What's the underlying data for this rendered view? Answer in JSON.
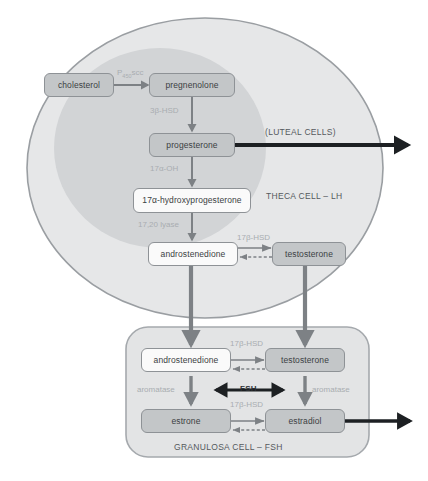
{
  "diagram": {
    "colors": {
      "theca_fill": "#e6e7e8",
      "theca_inner_fill": "#d2d4d6",
      "theca_stroke": "#9a9ea2",
      "granulosa_fill": "#e3e4e5",
      "granulosa_stroke": "#a5a9ad",
      "box_fill_gray": "#c3c6c8",
      "box_fill_white": "#fafafa",
      "box_stroke": "#8e9296",
      "arrow_gray": "#7d8185",
      "arrow_black": "#1d2023",
      "enzyme_text": "#a9adb1",
      "label_text": "#55595d"
    },
    "theca": {
      "cell_label": "THECA CELL – LH",
      "luteal_label": "(LUTEAL CELLS)",
      "nodes": [
        {
          "id": "cholesterol",
          "label": "cholesterol",
          "fill": "gray"
        },
        {
          "id": "pregnenolone",
          "label": "pregnenolone",
          "fill": "gray"
        },
        {
          "id": "progesterone",
          "label": "progesterone",
          "fill": "gray"
        },
        {
          "id": "hydroxyprogesterone",
          "label": "17α-hydroxyprogesterone",
          "fill": "white"
        },
        {
          "id": "androstenedione_theca",
          "label": "androstenedione",
          "fill": "white"
        },
        {
          "id": "testosterone_theca",
          "label": "testosterone",
          "fill": "gray"
        }
      ],
      "enzymes": [
        {
          "id": "p450scc",
          "label": "P450scc",
          "base": "P",
          "sub": "450",
          "tail": "scc"
        },
        {
          "id": "3b_hsd",
          "label": "3β-HSD"
        },
        {
          "id": "17a_oh",
          "label": "17α-OH"
        },
        {
          "id": "17_20_lyase",
          "label": "17,20 lyase"
        },
        {
          "id": "17b_hsd_theca",
          "label": "17β-HSD"
        }
      ]
    },
    "granulosa": {
      "cell_label": "GRANULOSA CELL – FSH",
      "nodes": [
        {
          "id": "androstenedione_gran",
          "label": "androstenedione",
          "fill": "white"
        },
        {
          "id": "testosterone_gran",
          "label": "testosterone",
          "fill": "gray"
        },
        {
          "id": "estrone",
          "label": "estrone",
          "fill": "gray"
        },
        {
          "id": "estradiol",
          "label": "estradiol",
          "fill": "gray"
        }
      ],
      "enzymes": [
        {
          "id": "17b_hsd_gran_top",
          "label": "17β-HSD"
        },
        {
          "id": "17b_hsd_gran_bottom",
          "label": "17β-HSD"
        },
        {
          "id": "aromatase_left",
          "label": "aromatase"
        },
        {
          "id": "aromatase_right",
          "label": "aromatase"
        }
      ],
      "fsh_label": "FSH"
    }
  }
}
